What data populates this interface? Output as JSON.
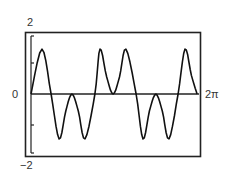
{
  "chart_data": {
    "type": "line",
    "title": "",
    "xlabel": "",
    "ylabel": "",
    "xlim": [
      0,
      6.2832
    ],
    "ylim": [
      -2,
      2
    ],
    "grid": false,
    "legend": null,
    "tick_labels": {
      "y_top": "2",
      "y_bottom": "−2",
      "x_left": "0",
      "x_right": "2π"
    },
    "y_ticks": [
      -1,
      1
    ],
    "series": [
      {
        "name": "f(x)",
        "x": [
          0,
          0.41,
          0.75,
          1.05,
          1.3,
          1.53,
          1.77,
          2.02,
          2.39,
          2.58,
          2.83,
          3.07,
          3.31,
          3.55,
          3.93,
          4.19,
          4.43,
          4.67,
          4.91,
          5.16,
          5.5,
          5.76,
          6.0,
          6.21
        ],
        "y": [
          0,
          1.45,
          0,
          -1.45,
          -0.55,
          0,
          -0.55,
          -1.45,
          0,
          1.45,
          0.55,
          0,
          0.55,
          1.45,
          0,
          -1.45,
          -0.55,
          0,
          -0.55,
          -1.45,
          0,
          1.45,
          0.6,
          0
        ]
      }
    ]
  },
  "labels": {
    "y_top": "2",
    "y_bottom": "−2",
    "x_left": "0",
    "x_right": "2π"
  }
}
